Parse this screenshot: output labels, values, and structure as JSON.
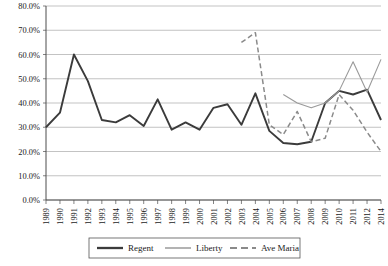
{
  "chart_data": {
    "type": "line",
    "title": "",
    "xlabel": "",
    "ylabel": "",
    "ylim": [
      0,
      80
    ],
    "ytick_labels": [
      "0.0%",
      "10.0%",
      "20.0%",
      "30.0%",
      "40.0%",
      "50.0%",
      "60.0%",
      "70.0%",
      "80.0%"
    ],
    "ytick_values": [
      0,
      10,
      20,
      30,
      40,
      50,
      60,
      70,
      80
    ],
    "grid": true,
    "legend_position": "bottom",
    "categories": [
      "1989",
      "1990",
      "1991",
      "1992",
      "1993",
      "1994",
      "1995",
      "1996",
      "1997",
      "1998",
      "1999",
      "2000",
      "2001",
      "2002",
      "2003",
      "2004",
      "2005",
      "2006",
      "2007",
      "2008",
      "2009",
      "2010",
      "2011",
      "2012",
      "2014"
    ],
    "series": [
      {
        "name": "Regent",
        "color": "#3b3b3b",
        "width": 1.9,
        "dash": "",
        "values": [
          30.0,
          36.0,
          60.0,
          49.0,
          33.0,
          32.0,
          35.0,
          30.5,
          41.5,
          29.0,
          32.0,
          29.0,
          38.0,
          39.5,
          31.0,
          44.0,
          28.5,
          23.5,
          23.0,
          24.0,
          40.0,
          45.0,
          43.5,
          45.5,
          33.0
        ]
      },
      {
        "name": "Liberty",
        "color": "#9a9a9a",
        "width": 1.1,
        "dash": "",
        "values": [
          null,
          null,
          null,
          null,
          null,
          null,
          null,
          null,
          null,
          null,
          null,
          null,
          null,
          null,
          null,
          null,
          null,
          43.5,
          40.0,
          38.0,
          40.0,
          45.0,
          57.0,
          44.5,
          58.0
        ]
      },
      {
        "name": "Ave Maria",
        "color": "#8a8a8a",
        "width": 1.5,
        "dash": "5,3",
        "values": [
          null,
          null,
          null,
          null,
          null,
          null,
          null,
          null,
          null,
          null,
          null,
          null,
          null,
          null,
          65.0,
          69.0,
          31.0,
          27.0,
          36.5,
          24.0,
          25.5,
          43.5,
          37.0,
          28.0,
          20.0
        ]
      }
    ]
  },
  "legend": {
    "items": [
      {
        "label": "Regent"
      },
      {
        "label": "Liberty"
      },
      {
        "label": "Ave Maria"
      }
    ]
  }
}
